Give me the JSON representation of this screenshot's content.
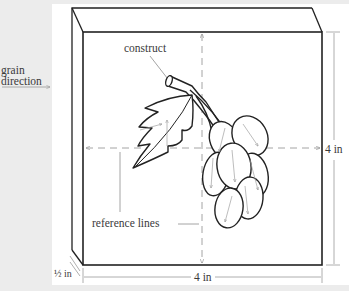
{
  "figure": {
    "labels": {
      "grain_line1": "grain",
      "grain_line2": "direction",
      "construct": "construct",
      "reference_lines": "reference lines",
      "height_dimension": "4 in",
      "width_dimension": "4 in",
      "thickness_dimension": "½ in"
    },
    "colors": {
      "background": "#ececec",
      "panel": "#ffffff",
      "outline": "#222222",
      "guide": "#9a9a9a",
      "text": "#3a3a3a"
    }
  }
}
